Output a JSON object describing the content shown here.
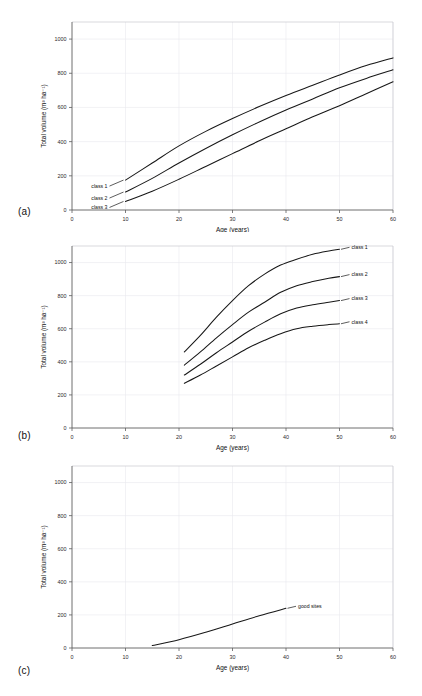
{
  "figure": {
    "panels": [
      {
        "id": "a",
        "letter": "(a)"
      },
      {
        "id": "b",
        "letter": "(b)"
      },
      {
        "id": "c",
        "letter": "(c)"
      }
    ]
  },
  "chart_data": [
    {
      "type": "line",
      "panel": "(a)",
      "title": "",
      "xlabel": "Age (years)",
      "ylabel": "Total volume (m³ ha⁻¹)",
      "xlim": [
        0,
        60
      ],
      "ylim": [
        0,
        1100
      ],
      "xticks": [
        0,
        10,
        20,
        30,
        40,
        50,
        60
      ],
      "yticks": [
        0,
        200,
        400,
        600,
        800,
        1000
      ],
      "grid": true,
      "legend_position": "inline-left",
      "series": [
        {
          "name": "class 1",
          "label_x": 10,
          "label_y": 175,
          "x": [
            10,
            15,
            20,
            25,
            30,
            35,
            40,
            45,
            50,
            55,
            60
          ],
          "values": [
            175,
            275,
            375,
            460,
            535,
            605,
            670,
            730,
            790,
            845,
            890
          ]
        },
        {
          "name": "class 2",
          "label_x": 10,
          "label_y": 105,
          "x": [
            10,
            15,
            20,
            25,
            30,
            35,
            40,
            45,
            50,
            55,
            60
          ],
          "values": [
            105,
            185,
            275,
            360,
            440,
            515,
            585,
            650,
            715,
            770,
            820
          ]
        },
        {
          "name": "class 3",
          "label_x": 10,
          "label_y": 50,
          "x": [
            10,
            15,
            20,
            25,
            30,
            35,
            40,
            45,
            50,
            55,
            60
          ],
          "values": [
            50,
            110,
            180,
            255,
            330,
            405,
            475,
            545,
            610,
            680,
            750
          ]
        }
      ]
    },
    {
      "type": "line",
      "panel": "(b)",
      "title": "",
      "xlabel": "Age (years)",
      "ylabel": "Total volume (m³ ha⁻¹)",
      "xlim": [
        0,
        60
      ],
      "ylim": [
        0,
        1100
      ],
      "xticks": [
        0,
        10,
        20,
        30,
        40,
        50,
        60
      ],
      "yticks": [
        0,
        200,
        400,
        600,
        800,
        1000
      ],
      "grid": true,
      "legend_position": "right-of-curve-end",
      "series": [
        {
          "name": "class 1",
          "label_x": 50,
          "label_y": 1080,
          "x": [
            21,
            24,
            27,
            30,
            33,
            36,
            39,
            42,
            45,
            48,
            50
          ],
          "values": [
            460,
            560,
            670,
            770,
            860,
            930,
            985,
            1020,
            1050,
            1070,
            1080
          ]
        },
        {
          "name": "class 2",
          "label_x": 50,
          "label_y": 915,
          "x": [
            21,
            24,
            27,
            30,
            33,
            36,
            39,
            42,
            45,
            48,
            50
          ],
          "values": [
            380,
            460,
            545,
            625,
            700,
            760,
            820,
            860,
            885,
            905,
            915
          ]
        },
        {
          "name": "class 3",
          "label_x": 50,
          "label_y": 770,
          "x": [
            21,
            24,
            27,
            30,
            33,
            36,
            39,
            42,
            45,
            48,
            50
          ],
          "values": [
            320,
            385,
            455,
            520,
            585,
            640,
            690,
            725,
            745,
            760,
            770
          ]
        },
        {
          "name": "class 4",
          "label_x": 50,
          "label_y": 630,
          "x": [
            21,
            24,
            27,
            30,
            33,
            36,
            39,
            42,
            45,
            48,
            50
          ],
          "values": [
            270,
            320,
            375,
            430,
            485,
            530,
            570,
            600,
            615,
            625,
            630
          ]
        }
      ]
    },
    {
      "type": "line",
      "panel": "(c)",
      "title": "",
      "xlabel": "Age (years)",
      "ylabel": "Total volume (m³ ha⁻¹)",
      "xlim": [
        0,
        60
      ],
      "ylim": [
        0,
        1100
      ],
      "xticks": [
        0,
        10,
        20,
        30,
        40,
        50,
        60
      ],
      "yticks": [
        0,
        200,
        400,
        600,
        800,
        1000
      ],
      "grid": true,
      "legend_position": "right-of-curve-end",
      "series": [
        {
          "name": "good sites",
          "label_x": 40,
          "label_y": 240,
          "x": [
            15,
            20,
            25,
            30,
            35,
            40
          ],
          "values": [
            15,
            50,
            95,
            145,
            195,
            240
          ]
        }
      ]
    }
  ]
}
